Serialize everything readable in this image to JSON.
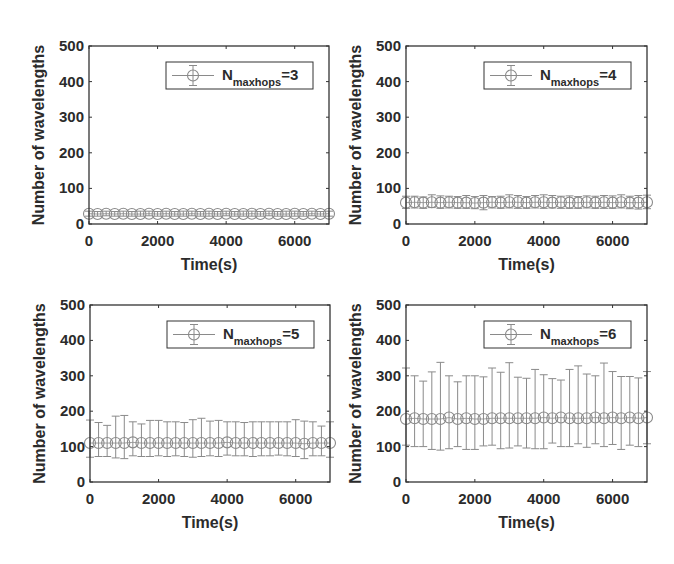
{
  "figure": {
    "width": 674,
    "height": 564,
    "axis_color": "#333333",
    "series_color": "#8a8a8a"
  },
  "chart_data": [
    {
      "type": "scatter",
      "subtype": "errorbar",
      "panel": "top-left",
      "title": "",
      "xlabel": "Time(s)",
      "ylabel": "Number of wavelengths",
      "xlim": [
        0,
        7000
      ],
      "ylim": [
        0,
        500
      ],
      "xticks": [
        0,
        2000,
        4000,
        6000
      ],
      "yticks": [
        0,
        100,
        200,
        300,
        400,
        500
      ],
      "grid": false,
      "legend": {
        "position": "upper right",
        "label_main": "N",
        "label_sub": "maxhops",
        "label_suffix": "=3"
      },
      "plot_box": {
        "x": 89,
        "y": 46,
        "w": 240,
        "h": 178
      },
      "series": [
        {
          "name": "N_maxhops=3",
          "x": [
            0,
            250,
            500,
            750,
            1000,
            1250,
            1500,
            1750,
            2000,
            2250,
            2500,
            2750,
            3000,
            3250,
            3500,
            3750,
            4000,
            4250,
            4500,
            4750,
            5000,
            5250,
            5500,
            5750,
            6000,
            6250,
            6500,
            6750,
            7000
          ],
          "y": [
            29,
            28,
            29,
            28,
            29,
            28,
            28,
            29,
            28,
            29,
            28,
            28,
            29,
            28,
            29,
            28,
            29,
            28,
            28,
            29,
            28,
            29,
            28,
            28,
            29,
            28,
            29,
            28,
            29
          ],
          "err_low": [
            22,
            22,
            23,
            22,
            22,
            22,
            22,
            23,
            22,
            22,
            22,
            22,
            23,
            22,
            22,
            22,
            23,
            22,
            22,
            22,
            22,
            23,
            22,
            22,
            22,
            22,
            23,
            22,
            22
          ],
          "err_high": [
            36,
            35,
            36,
            35,
            36,
            35,
            36,
            36,
            35,
            36,
            35,
            36,
            36,
            35,
            36,
            35,
            36,
            35,
            36,
            36,
            35,
            36,
            35,
            36,
            36,
            35,
            36,
            35,
            36
          ]
        }
      ]
    },
    {
      "type": "scatter",
      "subtype": "errorbar",
      "panel": "top-right",
      "title": "",
      "xlabel": "Time(s)",
      "ylabel": "Number of wavelengths",
      "xlim": [
        0,
        7000
      ],
      "ylim": [
        0,
        500
      ],
      "xticks": [
        0,
        2000,
        4000,
        6000
      ],
      "yticks": [
        0,
        100,
        200,
        300,
        400,
        500
      ],
      "grid": false,
      "legend": {
        "position": "upper right",
        "label_main": "N",
        "label_sub": "maxhops",
        "label_suffix": "=4"
      },
      "plot_box": {
        "x": 406,
        "y": 46,
        "w": 241,
        "h": 178
      },
      "series": [
        {
          "name": "N_maxhops=4",
          "x": [
            0,
            250,
            500,
            750,
            1000,
            1250,
            1500,
            1750,
            2000,
            2250,
            2500,
            2750,
            3000,
            3250,
            3500,
            3750,
            4000,
            4250,
            4500,
            4750,
            5000,
            5250,
            5500,
            5750,
            6000,
            6250,
            6500,
            6750,
            7000
          ],
          "y": [
            60,
            61,
            60,
            61,
            60,
            61,
            60,
            60,
            59,
            60,
            61,
            60,
            61,
            61,
            60,
            61,
            61,
            60,
            61,
            60,
            60,
            61,
            60,
            61,
            60,
            61,
            60,
            60,
            61
          ],
          "err_low": [
            44,
            45,
            44,
            46,
            44,
            45,
            44,
            44,
            43,
            40,
            45,
            44,
            45,
            44,
            44,
            45,
            44,
            45,
            44,
            44,
            44,
            45,
            44,
            44,
            44,
            45,
            43,
            42,
            43
          ],
          "err_high": [
            78,
            78,
            76,
            82,
            79,
            78,
            77,
            80,
            77,
            80,
            77,
            78,
            82,
            80,
            77,
            80,
            82,
            80,
            78,
            79,
            77,
            79,
            78,
            80,
            79,
            82,
            78,
            80,
            81
          ]
        }
      ]
    },
    {
      "type": "scatter",
      "subtype": "errorbar",
      "panel": "bottom-left",
      "title": "",
      "xlabel": "Time(s)",
      "ylabel": "Number of wavelengths",
      "xlim": [
        0,
        7000
      ],
      "ylim": [
        0,
        500
      ],
      "xticks": [
        0,
        2000,
        4000,
        6000
      ],
      "yticks": [
        0,
        100,
        200,
        300,
        400,
        500
      ],
      "grid": false,
      "legend": {
        "position": "upper right",
        "label_main": "N",
        "label_sub": "maxhops",
        "label_suffix": "=5"
      },
      "plot_box": {
        "x": 90,
        "y": 305,
        "w": 240,
        "h": 177
      },
      "series": [
        {
          "name": "N_maxhops=5",
          "x": [
            0,
            250,
            500,
            750,
            1000,
            1250,
            1500,
            1750,
            2000,
            2250,
            2500,
            2750,
            3000,
            3250,
            3500,
            3750,
            4000,
            4250,
            4500,
            4750,
            5000,
            5250,
            5500,
            5750,
            6000,
            6250,
            6500,
            6750,
            7000
          ],
          "y": [
            110,
            110,
            110,
            110,
            110,
            112,
            110,
            110,
            110,
            110,
            110,
            110,
            110,
            110,
            110,
            110,
            112,
            110,
            110,
            110,
            110,
            110,
            110,
            110,
            110,
            108,
            110,
            110,
            110
          ],
          "err_low": [
            70,
            72,
            72,
            68,
            66,
            74,
            72,
            72,
            74,
            72,
            74,
            72,
            70,
            72,
            74,
            72,
            76,
            74,
            74,
            72,
            74,
            74,
            76,
            74,
            72,
            66,
            74,
            74,
            70
          ],
          "err_high": [
            175,
            168,
            160,
            186,
            188,
            170,
            164,
            174,
            174,
            170,
            170,
            168,
            176,
            180,
            172,
            174,
            170,
            170,
            168,
            170,
            170,
            170,
            170,
            170,
            176,
            172,
            170,
            158,
            170
          ]
        }
      ]
    },
    {
      "type": "scatter",
      "subtype": "errorbar",
      "panel": "bottom-right",
      "title": "",
      "xlabel": "Time(s)",
      "ylabel": "Number of wavelengths",
      "xlim": [
        0,
        7000
      ],
      "ylim": [
        0,
        500
      ],
      "xticks": [
        0,
        2000,
        4000,
        6000
      ],
      "yticks": [
        0,
        100,
        200,
        300,
        400,
        500
      ],
      "grid": false,
      "legend": {
        "position": "upper right",
        "label_main": "N",
        "label_sub": "maxhops",
        "label_suffix": "=6"
      },
      "plot_box": {
        "x": 406,
        "y": 305,
        "w": 241,
        "h": 177
      },
      "series": [
        {
          "name": "N_maxhops=6",
          "x": [
            0,
            250,
            500,
            750,
            1000,
            1250,
            1500,
            1750,
            2000,
            2250,
            2500,
            2750,
            3000,
            3250,
            3500,
            3750,
            4000,
            4250,
            4500,
            4750,
            5000,
            5250,
            5500,
            5750,
            6000,
            6250,
            6500,
            6750,
            7000
          ],
          "y": [
            178,
            180,
            178,
            178,
            178,
            182,
            178,
            180,
            178,
            178,
            180,
            180,
            180,
            180,
            180,
            180,
            182,
            180,
            182,
            180,
            180,
            180,
            182,
            180,
            182,
            180,
            182,
            180,
            182
          ],
          "err_low": [
            104,
            100,
            100,
            92,
            90,
            94,
            100,
            92,
            92,
            102,
            104,
            94,
            96,
            102,
            96,
            94,
            94,
            110,
            100,
            100,
            108,
            98,
            108,
            100,
            106,
            92,
            104,
            100,
            108
          ],
          "err_high": [
            322,
            300,
            285,
            311,
            338,
            300,
            283,
            300,
            300,
            297,
            322,
            310,
            337,
            296,
            293,
            318,
            303,
            292,
            288,
            318,
            328,
            305,
            300,
            336,
            312,
            298,
            298,
            294,
            312
          ]
        }
      ]
    }
  ]
}
